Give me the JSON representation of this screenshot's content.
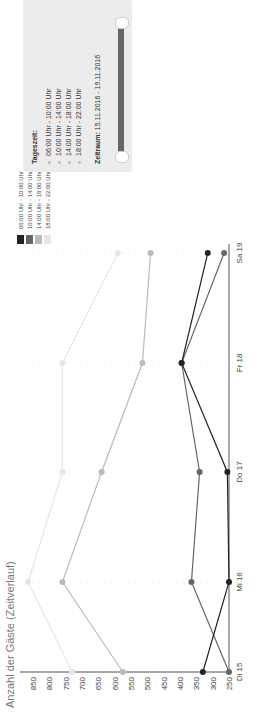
{
  "chart_data": {
    "type": "line",
    "title": "Anzahl der Gäste (Zeitverlauf)",
    "xlabel": "",
    "ylabel": "",
    "categories": [
      "Di 15",
      "Mi 16",
      "Do 17",
      "Fr 18",
      "Sa 19"
    ],
    "yticks": [
      850,
      800,
      750,
      700,
      650,
      600,
      550,
      500,
      450,
      400,
      350,
      300,
      250
    ],
    "ylim": [
      250,
      850
    ],
    "grid": false,
    "legend_position": "right",
    "series": [
      {
        "name": "06:00 Uhr - 10:00 Uhr",
        "color": "#222222",
        "values": [
          330,
          250,
          255,
          395,
          315
        ]
      },
      {
        "name": "10:00 Uhr - 14:00 Uhr",
        "color": "#666666",
        "values": [
          250,
          365,
          340,
          395,
          265
        ]
      },
      {
        "name": "14:00 Uhr - 18:00 Uhr",
        "color": "#bbbbbb",
        "values": [
          575,
          760,
          640,
          515,
          490
        ]
      },
      {
        "name": "18:00 Uhr - 22:00 Uhr",
        "color": "#e6e6e6",
        "values": [
          730,
          865,
          760,
          760,
          590
        ]
      }
    ]
  },
  "filter_panel": {
    "title": "Tageszeit:",
    "options": [
      "06:00 Uhr - 10:00 Uhr",
      "10:00 Uhr - 14:00 Uhr",
      "14:00 Uhr - 18:00 Uhr",
      "18:00 Uhr - 22:00 Uhr"
    ],
    "zeitraum_label": "Zeitraum:",
    "zeitraum_value": "15.11.2016 - 19.11.2016"
  }
}
